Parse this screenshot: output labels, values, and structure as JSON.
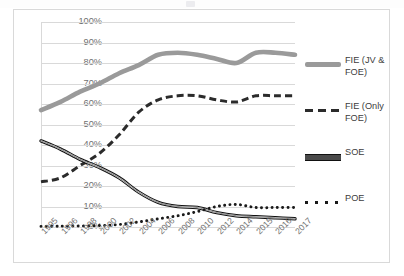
{
  "chart_data": {
    "type": "line",
    "title": "",
    "xlabel": "",
    "ylabel": "",
    "ylim": [
      0,
      100
    ],
    "ytick_labels": [
      "100%",
      "90%",
      "80%",
      "70%",
      "60%",
      "50%",
      "40%",
      "30%",
      "20%",
      "10%",
      "0%"
    ],
    "ytick_values": [
      100,
      90,
      80,
      70,
      60,
      50,
      40,
      30,
      20,
      10,
      0
    ],
    "grid": true,
    "legend_position": "right",
    "categories": [
      "1995",
      "1996",
      "1998",
      "2000",
      "2002",
      "2004",
      "2006",
      "2008",
      "2010",
      "2012",
      "2014",
      "2015",
      "2016",
      "2017"
    ],
    "series": [
      {
        "name": "FIE (JV & FOE)",
        "style": "thick-solid",
        "color": "#9a9a9a",
        "values": [
          57,
          61,
          66,
          70,
          75,
          79,
          84,
          85,
          84,
          82,
          80,
          85,
          85,
          84
        ]
      },
      {
        "name": "FIE (Only FOE)",
        "style": "dashed",
        "color": "#2b2b2b",
        "values": [
          22,
          24,
          30,
          36,
          45,
          56,
          62,
          64,
          64,
          62,
          61,
          64,
          64,
          64
        ]
      },
      {
        "name": "SOE",
        "style": "double-solid",
        "color": "#333333",
        "values": [
          42,
          38,
          33,
          29,
          24,
          17,
          12,
          10,
          9.5,
          7,
          5.5,
          5,
          4.5,
          4
        ]
      },
      {
        "name": "POE",
        "style": "dotted",
        "color": "#1a1a1a",
        "values": [
          0.3,
          0.4,
          0.5,
          0.7,
          1.2,
          2.5,
          4,
          5.5,
          7.5,
          10,
          11,
          9.5,
          9.5,
          9.5
        ]
      }
    ]
  },
  "legend": {
    "items": [
      {
        "label": "FIE (JV & FOE)",
        "marker": "thick-solid-line-gray"
      },
      {
        "label": "FIE (Only FOE)",
        "marker": "dashed-line-dark"
      },
      {
        "label": "SOE",
        "marker": "double-solid-line-black"
      },
      {
        "label": "POE",
        "marker": "dotted-line-black"
      }
    ]
  },
  "colors": {
    "fie_jv_foe": "#9a9a9a",
    "fie_only_foe": "#2b2b2b",
    "soe": "#333333",
    "poe": "#1a1a1a",
    "gridline": "#d9d9d9",
    "axis_text": "#6f6f6f",
    "frame_border": "#d9d9d9"
  }
}
